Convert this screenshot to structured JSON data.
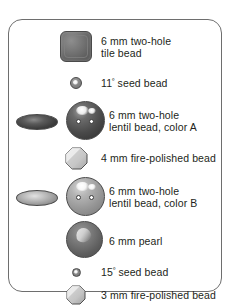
{
  "panel": {
    "title": "bead legend",
    "border_color": "#6e6e6e",
    "background_color": "#ffffff",
    "text_color": "#231f20"
  },
  "rows": [
    {
      "id": "tile-bead",
      "icon": "rounded-square-tile-bead-icon",
      "label_line1": "6 mm two-hole",
      "label_line2": "tile bead",
      "color": "#707070"
    },
    {
      "id": "seed-bead-11",
      "icon": "small-circle-seed-bead-icon",
      "label_line1": "11º seed bead",
      "label_line2": "",
      "color": "#7d7d7d"
    },
    {
      "id": "lentil-bead-color-a",
      "icon": "two-hole-lentil-bead-dark-icon",
      "label_line1": "6 mm two-hole",
      "label_line2": "lentil bead, color A",
      "color": "#4a4a4a"
    },
    {
      "id": "fire-polished-bead-4mm",
      "icon": "octagon-fire-polished-bead-icon",
      "label_line1": "4 mm fire-polished bead",
      "label_line2": "",
      "color": "#b9b9b9"
    },
    {
      "id": "lentil-bead-color-b",
      "icon": "two-hole-lentil-bead-light-icon",
      "label_line1": "6 mm two-hole",
      "label_line2": "lentil bead, color B",
      "color": "#9a9a9a"
    },
    {
      "id": "pearl-6mm",
      "icon": "pearl-sphere-icon",
      "label_line1": "6 mm pearl",
      "label_line2": "",
      "color": "#6b6b6b"
    },
    {
      "id": "seed-bead-15",
      "icon": "tiny-circle-seed-bead-icon",
      "label_line1": "15º seed bead",
      "label_line2": "",
      "color": "#6e6e6e"
    },
    {
      "id": "fire-polished-bead-3mm",
      "icon": "octagon-fire-polished-bead-small-icon",
      "label_line1": "3 mm fire-polished bead",
      "label_line2": "",
      "color": "#bcbcbc"
    }
  ]
}
